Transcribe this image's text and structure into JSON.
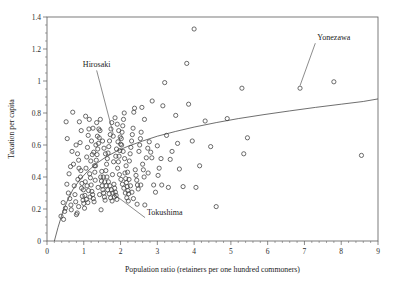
{
  "chart_data": {
    "type": "scatter",
    "title": "",
    "xlabel": "Population ratio (retainers per one hundred commoners)",
    "ylabel": "Taxation per capita",
    "xlim": [
      0,
      9
    ],
    "ylim": [
      0,
      1.4
    ],
    "xticks": [
      "0",
      "1",
      "2",
      "3",
      "4",
      "5",
      "6",
      "7",
      "8",
      "9"
    ],
    "xtick_values": [
      0,
      1,
      2,
      3,
      4,
      5,
      6,
      7,
      8,
      9
    ],
    "yticks": [
      "0",
      "0.2",
      "0.4",
      "0.6",
      "0.8",
      "1",
      "1.2",
      "1.4"
    ],
    "ytick_values": [
      0,
      0.2,
      0.4,
      0.6,
      0.8,
      1,
      1.2,
      1.4
    ],
    "grid": false,
    "legend": null,
    "minor_ticks_x_per_interval": 5,
    "minor_ticks_y_per_interval": 4,
    "marker_style": "open-circle",
    "annotations": [
      {
        "label": "Hirosaki",
        "label_x": 1.35,
        "label_y": 1.085,
        "point_x": 1.8,
        "point_y": 0.655
      },
      {
        "label": "Yonezawa",
        "label_x": 7.35,
        "label_y": 1.255,
        "point_x": 6.88,
        "point_y": 0.955
      },
      {
        "label": "Tokushima",
        "label_x": 2.72,
        "label_y": 0.165,
        "point_x": 1.83,
        "point_y": 0.275
      }
    ],
    "fit_curve": {
      "description": "logarithmic regression line",
      "points": [
        [
          0.2,
          0.0
        ],
        [
          0.3,
          0.085
        ],
        [
          0.42,
          0.175
        ],
        [
          0.55,
          0.25
        ],
        [
          0.7,
          0.32
        ],
        [
          0.9,
          0.385
        ],
        [
          1.1,
          0.435
        ],
        [
          1.35,
          0.485
        ],
        [
          1.6,
          0.525
        ],
        [
          1.9,
          0.562
        ],
        [
          2.2,
          0.592
        ],
        [
          2.6,
          0.625
        ],
        [
          3.0,
          0.655
        ],
        [
          3.5,
          0.685
        ],
        [
          4.0,
          0.712
        ],
        [
          4.6,
          0.74
        ],
        [
          5.2,
          0.765
        ],
        [
          5.9,
          0.79
        ],
        [
          6.6,
          0.813
        ],
        [
          7.3,
          0.835
        ],
        [
          8.0,
          0.855
        ],
        [
          8.6,
          0.872
        ],
        [
          9.0,
          0.888
        ]
      ]
    },
    "points": [
      [
        0.38,
        0.155
      ],
      [
        0.45,
        0.135
      ],
      [
        0.48,
        0.185
      ],
      [
        0.5,
        0.205
      ],
      [
        0.52,
        0.745
      ],
      [
        0.55,
        0.64
      ],
      [
        0.58,
        0.3
      ],
      [
        0.6,
        0.42
      ],
      [
        0.62,
        0.265
      ],
      [
        0.65,
        0.225
      ],
      [
        0.68,
        0.56
      ],
      [
        0.7,
        0.805
      ],
      [
        0.72,
        0.48
      ],
      [
        0.74,
        0.345
      ],
      [
        0.76,
        0.29
      ],
      [
        0.78,
        0.245
      ],
      [
        0.8,
        0.165
      ],
      [
        0.82,
        0.175
      ],
      [
        0.84,
        0.385
      ],
      [
        0.86,
        0.505
      ],
      [
        0.88,
        0.745
      ],
      [
        0.9,
        0.615
      ],
      [
        0.92,
        0.44
      ],
      [
        0.94,
        0.33
      ],
      [
        0.96,
        0.28
      ],
      [
        0.98,
        0.255
      ],
      [
        1.0,
        0.235
      ],
      [
        1.02,
        0.205
      ],
      [
        1.04,
        0.37
      ],
      [
        1.06,
        0.455
      ],
      [
        1.08,
        0.525
      ],
      [
        1.1,
        0.585
      ],
      [
        1.12,
        0.66
      ],
      [
        1.14,
        0.7
      ],
      [
        1.16,
        0.42
      ],
      [
        1.18,
        0.395
      ],
      [
        1.2,
        0.35
      ],
      [
        1.22,
        0.31
      ],
      [
        1.24,
        0.29
      ],
      [
        1.26,
        0.265
      ],
      [
        1.28,
        0.245
      ],
      [
        1.3,
        0.43
      ],
      [
        1.32,
        0.47
      ],
      [
        1.34,
        0.505
      ],
      [
        1.36,
        0.54
      ],
      [
        1.38,
        0.575
      ],
      [
        1.4,
        0.61
      ],
      [
        1.42,
        0.645
      ],
      [
        1.44,
        0.69
      ],
      [
        1.46,
        0.4
      ],
      [
        1.48,
        0.375
      ],
      [
        1.5,
        0.345
      ],
      [
        1.52,
        0.32
      ],
      [
        1.54,
        0.3
      ],
      [
        1.56,
        0.275
      ],
      [
        1.58,
        0.255
      ],
      [
        1.6,
        0.44
      ],
      [
        1.62,
        0.48
      ],
      [
        1.64,
        0.515
      ],
      [
        1.66,
        0.55
      ],
      [
        1.68,
        0.59
      ],
      [
        1.7,
        0.625
      ],
      [
        1.72,
        0.665
      ],
      [
        1.74,
        0.7
      ],
      [
        1.76,
        0.74
      ],
      [
        1.78,
        0.415
      ],
      [
        1.8,
        0.655
      ],
      [
        1.82,
        0.355
      ],
      [
        1.84,
        0.33
      ],
      [
        1.86,
        0.305
      ],
      [
        1.88,
        0.285
      ],
      [
        1.9,
        0.26
      ],
      [
        1.83,
        0.275
      ],
      [
        1.92,
        0.455
      ],
      [
        1.94,
        0.495
      ],
      [
        1.96,
        0.53
      ],
      [
        1.98,
        0.565
      ],
      [
        2.0,
        0.605
      ],
      [
        2.02,
        0.64
      ],
      [
        2.04,
        0.68
      ],
      [
        2.06,
        0.72
      ],
      [
        2.08,
        0.76
      ],
      [
        2.1,
        0.8
      ],
      [
        2.12,
        0.425
      ],
      [
        2.14,
        0.39
      ],
      [
        2.16,
        0.365
      ],
      [
        2.18,
        0.34
      ],
      [
        2.2,
        0.315
      ],
      [
        2.22,
        0.295
      ],
      [
        2.24,
        0.5
      ],
      [
        2.26,
        0.545
      ],
      [
        2.28,
        0.585
      ],
      [
        2.3,
        0.625
      ],
      [
        2.32,
        0.665
      ],
      [
        2.34,
        0.705
      ],
      [
        2.36,
        0.805
      ],
      [
        2.38,
        0.83
      ],
      [
        2.4,
        0.445
      ],
      [
        2.42,
        0.41
      ],
      [
        2.44,
        0.38
      ],
      [
        2.46,
        0.35
      ],
      [
        2.48,
        0.325
      ],
      [
        2.5,
        0.56
      ],
      [
        2.52,
        0.6
      ],
      [
        2.54,
        0.64
      ],
      [
        2.56,
        0.68
      ],
      [
        2.58,
        0.835
      ],
      [
        2.6,
        0.48
      ],
      [
        2.62,
        0.445
      ],
      [
        2.64,
        0.4
      ],
      [
        2.66,
        0.225
      ],
      [
        2.7,
        0.52
      ],
      [
        2.74,
        0.58
      ],
      [
        2.78,
        0.62
      ],
      [
        2.82,
        0.555
      ],
      [
        2.86,
        0.875
      ],
      [
        2.9,
        0.35
      ],
      [
        2.95,
        0.305
      ],
      [
        3.0,
        0.595
      ],
      [
        3.05,
        0.455
      ],
      [
        3.1,
        0.515
      ],
      [
        3.15,
        0.845
      ],
      [
        3.2,
        0.99
      ],
      [
        3.25,
        0.66
      ],
      [
        3.3,
        0.335
      ],
      [
        3.4,
        0.56
      ],
      [
        3.5,
        0.785
      ],
      [
        3.55,
        0.61
      ],
      [
        3.6,
        0.45
      ],
      [
        3.7,
        0.34
      ],
      [
        3.8,
        1.11
      ],
      [
        3.85,
        0.855
      ],
      [
        3.95,
        0.625
      ],
      [
        4.0,
        1.325
      ],
      [
        4.05,
        0.335
      ],
      [
        4.15,
        0.47
      ],
      [
        4.3,
        0.75
      ],
      [
        4.45,
        0.59
      ],
      [
        4.6,
        0.215
      ],
      [
        4.9,
        0.765
      ],
      [
        5.3,
        0.955
      ],
      [
        5.35,
        0.545
      ],
      [
        5.45,
        0.645
      ],
      [
        6.88,
        0.955
      ],
      [
        7.8,
        0.995
      ],
      [
        8.55,
        0.535
      ],
      [
        0.44,
        0.24
      ],
      [
        0.54,
        0.355
      ],
      [
        0.64,
        0.465
      ],
      [
        0.66,
        0.195
      ],
      [
        0.86,
        0.215
      ],
      [
        0.93,
        0.69
      ],
      [
        1.05,
        0.78
      ],
      [
        1.15,
        0.76
      ],
      [
        1.21,
        0.625
      ],
      [
        1.27,
        0.555
      ],
      [
        1.33,
        0.6
      ],
      [
        1.37,
        0.655
      ],
      [
        1.41,
        0.7
      ],
      [
        1.45,
        0.76
      ],
      [
        1.47,
        0.195
      ],
      [
        1.51,
        0.625
      ],
      [
        1.55,
        0.58
      ],
      [
        1.59,
        0.545
      ],
      [
        1.63,
        0.4
      ],
      [
        1.67,
        0.37
      ],
      [
        1.71,
        0.345
      ],
      [
        1.75,
        0.32
      ],
      [
        1.79,
        0.3
      ],
      [
        1.85,
        0.77
      ],
      [
        1.91,
        0.73
      ],
      [
        1.95,
        0.69
      ],
      [
        1.99,
        0.65
      ],
      [
        2.03,
        0.6
      ],
      [
        2.07,
        0.56
      ],
      [
        2.11,
        0.515
      ],
      [
        2.15,
        0.47
      ],
      [
        2.19,
        0.43
      ],
      [
        2.23,
        0.385
      ],
      [
        2.27,
        0.345
      ],
      [
        2.31,
        0.305
      ],
      [
        2.35,
        0.265
      ],
      [
        2.45,
        0.23
      ],
      [
        2.55,
        0.35
      ],
      [
        2.65,
        0.76
      ],
      [
        2.75,
        0.425
      ],
      [
        2.85,
        0.52
      ],
      [
        3.02,
        0.41
      ],
      [
        3.12,
        0.35
      ],
      [
        3.35,
        0.51
      ],
      [
        1.09,
        0.345
      ],
      [
        1.13,
        0.315
      ],
      [
        1.17,
        0.275
      ],
      [
        1.19,
        0.5
      ],
      [
        1.23,
        0.54
      ],
      [
        1.29,
        0.47
      ],
      [
        1.31,
        0.38
      ],
      [
        1.39,
        0.335
      ],
      [
        1.43,
        0.29
      ],
      [
        1.49,
        0.435
      ],
      [
        1.53,
        0.4
      ],
      [
        1.57,
        0.37
      ],
      [
        1.61,
        0.345
      ],
      [
        1.65,
        0.32
      ],
      [
        1.69,
        0.295
      ],
      [
        1.73,
        0.27
      ],
      [
        1.77,
        0.25
      ],
      [
        1.81,
        0.495
      ],
      [
        1.87,
        0.53
      ],
      [
        1.89,
        0.575
      ],
      [
        1.93,
        0.62
      ],
      [
        1.97,
        0.415
      ],
      [
        2.01,
        0.385
      ],
      [
        2.05,
        0.355
      ],
      [
        2.09,
        0.33
      ],
      [
        2.13,
        0.3
      ],
      [
        2.17,
        0.27
      ],
      [
        2.21,
        0.25
      ],
      [
        0.79,
        0.6
      ],
      [
        0.83,
        0.545
      ],
      [
        0.87,
        0.455
      ],
      [
        0.91,
        0.4
      ],
      [
        0.95,
        0.36
      ],
      [
        0.99,
        0.32
      ],
      [
        1.03,
        0.285
      ],
      [
        1.07,
        0.26
      ],
      [
        1.11,
        0.24
      ],
      [
        1.25,
        0.705
      ],
      [
        1.35,
        0.74
      ]
    ]
  }
}
